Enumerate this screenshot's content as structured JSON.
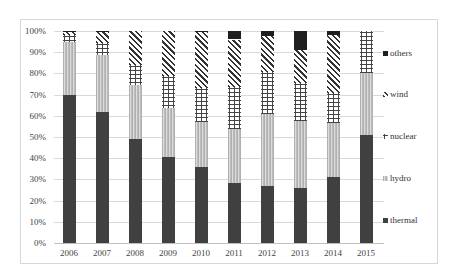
{
  "chart_data": {
    "type": "bar",
    "stacked": true,
    "normalized": true,
    "title": "",
    "xlabel": "",
    "ylabel": "",
    "ylim": [
      0,
      100
    ],
    "yticks": [
      "0%",
      "10%",
      "20%",
      "30%",
      "40%",
      "50%",
      "60%",
      "70%",
      "80%",
      "90%",
      "100%"
    ],
    "categories": [
      "2006",
      "2007",
      "2008",
      "2009",
      "2010",
      "2011",
      "2012",
      "2013",
      "2014",
      "2015"
    ],
    "series": [
      {
        "name": "thermal",
        "values": [
          70,
          62,
          49,
          40.5,
          36,
          28.5,
          27,
          26,
          31,
          51
        ]
      },
      {
        "name": "hydro",
        "values": [
          24.8,
          26.5,
          25.4,
          23,
          21,
          25.5,
          33.8,
          31.7,
          25.7,
          29
        ]
      },
      {
        "name": "nuclear",
        "values": [
          3.5,
          5.7,
          9.4,
          15.3,
          16,
          19.5,
          19.9,
          17.8,
          14.1,
          20
        ]
      },
      {
        "name": "wind",
        "values": [
          1.2,
          5.3,
          16.2,
          21.2,
          26.5,
          22.5,
          17,
          15.5,
          27.2,
          0
        ]
      },
      {
        "name": "others",
        "values": [
          0.5,
          0.5,
          0,
          0,
          0.5,
          4,
          2.3,
          9,
          2,
          0
        ]
      }
    ],
    "legend": [
      "others",
      "wind",
      "nuclear",
      "hydro",
      "thermal"
    ],
    "legend_position": "right",
    "grid": true
  }
}
